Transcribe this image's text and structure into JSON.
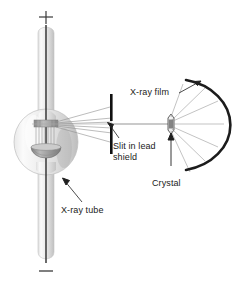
{
  "figure": {
    "background_color": "#ffffff",
    "width": 240,
    "height": 287
  },
  "labels": {
    "xray_film": "X-ray film",
    "slit_line1": "Slit in lead",
    "slit_line2": "shield",
    "crystal": "Crystal",
    "xray_tube": "X-ray tube",
    "terminal_positive": "+",
    "terminal_negative": "−"
  },
  "colors": {
    "ink": "#1a1a1a",
    "film_arc": "#1c1c1c",
    "lead_shield": "#111111",
    "glass_light": "#f2f2f2",
    "glass_mid": "#d8d8d8",
    "glass_shadow": "#b4b4b4",
    "electrode": "#2b2b2b",
    "ray": "#8c8c8c",
    "beam": "#b9b9b9",
    "anode": "#9a9a9a",
    "cathode": "#a5a5a5"
  },
  "components": [
    {
      "name": "x-ray-tube",
      "label": "X-ray tube"
    },
    {
      "name": "lead-shield-slit",
      "label": "Slit in lead shield"
    },
    {
      "name": "crystal",
      "label": "Crystal"
    },
    {
      "name": "x-ray-film",
      "label": "X-ray film"
    },
    {
      "name": "positive-terminal",
      "label": "+"
    },
    {
      "name": "negative-terminal",
      "label": "−"
    }
  ]
}
